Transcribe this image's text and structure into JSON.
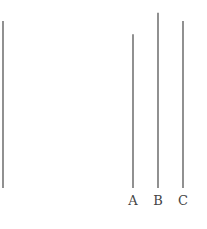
{
  "diagram": {
    "line_color": "#555555",
    "reference_line": {
      "relative_length": 1.0
    },
    "comparison_lines": [
      {
        "label": "A",
        "relative_length": 0.92
      },
      {
        "label": "B",
        "relative_length": 1.05
      },
      {
        "label": "C",
        "relative_length": 1.0
      }
    ]
  }
}
